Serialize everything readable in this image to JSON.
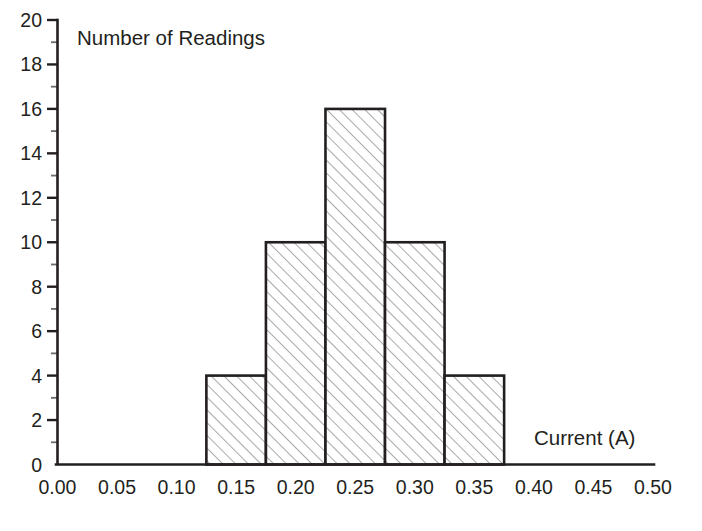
{
  "chart_data": {
    "type": "bar",
    "title": "Number of Readings",
    "subtitle": "",
    "xlabel": "Current (A)",
    "ylabel": "Number of Readings",
    "xlim": [
      0.0,
      0.5
    ],
    "ylim": [
      0,
      20
    ],
    "grid": false,
    "legend": null,
    "bin_edges": [
      0.125,
      0.175,
      0.225,
      0.275,
      0.325,
      0.375
    ],
    "bin_width": 0.05,
    "categories": [
      "0.125-0.175",
      "0.175-0.225",
      "0.225-0.275",
      "0.275-0.325",
      "0.325-0.375"
    ],
    "values": [
      4,
      10,
      16,
      10,
      4
    ],
    "bars": [
      {
        "x0": 0.125,
        "x1": 0.175,
        "height": 4
      },
      {
        "x0": 0.175,
        "x1": 0.225,
        "height": 10
      },
      {
        "x0": 0.225,
        "x1": 0.275,
        "height": 16
      },
      {
        "x0": 0.275,
        "x1": 0.325,
        "height": 10
      },
      {
        "x0": 0.325,
        "x1": 0.375,
        "height": 4
      }
    ],
    "x_ticks": [
      0.0,
      0.05,
      0.1,
      0.15,
      0.2,
      0.25,
      0.3,
      0.35,
      0.4,
      0.45,
      0.5
    ],
    "x_tick_labels": [
      "0.00",
      "0.05",
      "0.10",
      "0.15",
      "0.20",
      "0.25",
      "0.30",
      "0.35",
      "0.40",
      "0.45",
      "0.50"
    ],
    "y_ticks_major": [
      0,
      2,
      4,
      6,
      8,
      10,
      12,
      14,
      16,
      18,
      20
    ],
    "y_tick_labels": [
      "0",
      "2",
      "4",
      "6",
      "8",
      "10",
      "12",
      "14",
      "16",
      "18",
      "20"
    ],
    "y_ticks_minor": [
      1,
      3,
      5,
      7,
      9,
      11,
      13,
      15,
      17,
      19
    ],
    "total_readings": 44,
    "colors": {
      "axis": "#231f20",
      "text": "#231f20",
      "bar_edge": "#231f20",
      "bar_hatch": "#8c8c8c",
      "background": "#ffffff"
    }
  }
}
